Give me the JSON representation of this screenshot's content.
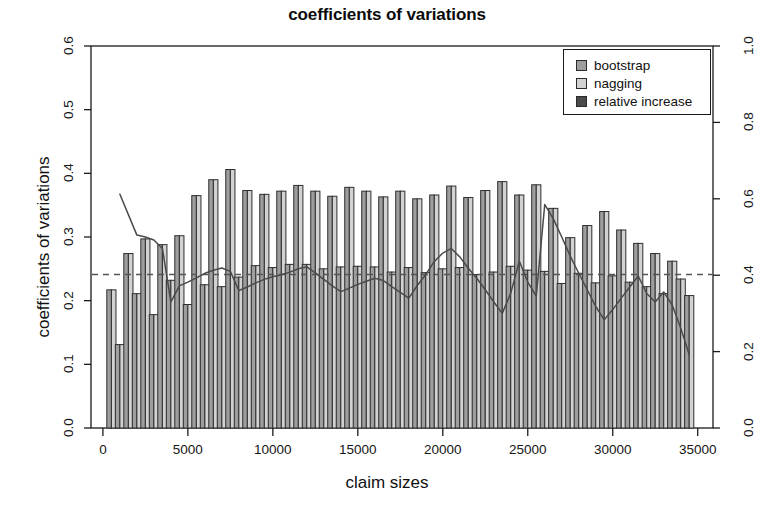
{
  "chart_data": {
    "type": "bar",
    "title": "coefficients of variations",
    "xlabel": "claim sizes",
    "ylabel": "coefficients of variations",
    "ylabel_right": "",
    "xlim": [
      -700,
      35900
    ],
    "ylim": [
      0.0,
      0.6
    ],
    "ylim_right": [
      0.0,
      1.0
    ],
    "grid": false,
    "xticks": [
      0,
      5000,
      10000,
      15000,
      20000,
      25000,
      30000,
      35000
    ],
    "xticklabels": [
      "0",
      "5000",
      "10000",
      "15000",
      "20000",
      "25000",
      "30000",
      "35000"
    ],
    "yticks": [
      0.0,
      0.1,
      0.2,
      0.3,
      0.4,
      0.5,
      0.6
    ],
    "yticklabels": [
      "0.0",
      "0.1",
      "0.2",
      "0.3",
      "0.4",
      "0.5",
      "0.6"
    ],
    "yticks_right": [
      0.0,
      0.2,
      0.4,
      0.6,
      0.8,
      1.0
    ],
    "yticklabels_right": [
      "0.0",
      "0.2",
      "0.4",
      "0.6",
      "0.8",
      "1.0"
    ],
    "legend": {
      "position": "top-right",
      "entries": [
        {
          "label": "bootstrap",
          "color": "#9e9e9e"
        },
        {
          "label": "nagging",
          "color": "#d2d2d2"
        },
        {
          "label": "relative increase",
          "color": "#4a4a4a"
        }
      ]
    },
    "reference_line": {
      "label": "mean reference",
      "value": 0.241,
      "style": "dashed",
      "color": "#555555"
    },
    "x": [
      500,
      1000,
      1500,
      2000,
      2500,
      3000,
      3500,
      4000,
      4500,
      5000,
      5500,
      6000,
      6500,
      7000,
      7500,
      8000,
      8500,
      9000,
      9500,
      10000,
      10500,
      11000,
      11500,
      12000,
      12500,
      13000,
      13500,
      14000,
      14500,
      15000,
      15500,
      16000,
      16500,
      17000,
      17500,
      18000,
      18500,
      19000,
      19500,
      20000,
      20500,
      21000,
      21500,
      22000,
      22500,
      23000,
      23500,
      24000,
      24500,
      25000,
      25500,
      26000,
      26500,
      27000,
      27500,
      28000,
      28500,
      29000,
      29500,
      30000,
      30500,
      31000,
      31500,
      32000,
      32500,
      33000,
      33500,
      34000,
      34500
    ],
    "categories": [
      "500",
      "1000",
      "1500",
      "2000",
      "2500",
      "3000",
      "3500",
      "4000",
      "4500",
      "5000",
      "5500",
      "6000",
      "6500",
      "7000",
      "7500",
      "8000",
      "8500",
      "9000",
      "9500",
      "10000",
      "10500",
      "11000",
      "11500",
      "12000",
      "12500",
      "13000",
      "13500",
      "14000",
      "14500",
      "15000",
      "15500",
      "16000",
      "16500",
      "17000",
      "17500",
      "18000",
      "18500",
      "19000",
      "19500",
      "20000",
      "20500",
      "21000",
      "21500",
      "22000",
      "22500",
      "23000",
      "23500",
      "24000",
      "24500",
      "25000",
      "25500",
      "26000",
      "26500",
      "27000",
      "27500",
      "28000",
      "28500",
      "29000",
      "29500",
      "30000",
      "30500",
      "31000",
      "31500",
      "32000",
      "32500",
      "33000",
      "33500",
      "34000",
      "34500"
    ],
    "series": [
      {
        "name": "bootstrap",
        "color": "#9e9e9e",
        "values": [
          0.217,
          0.131,
          0.274,
          0.211,
          0.297,
          0.178,
          0.288,
          0.232,
          0.302,
          0.194,
          0.365,
          0.225,
          0.39,
          0.222,
          0.406,
          0.237,
          0.373,
          0.255,
          0.367,
          0.252,
          0.372,
          0.257,
          0.381,
          0.257,
          0.372,
          0.25,
          0.364,
          0.253,
          0.378,
          0.254,
          0.372,
          0.253,
          0.363,
          0.245,
          0.372,
          0.252,
          0.36,
          0.244,
          0.366,
          0.25,
          0.38,
          0.252,
          0.362,
          0.241,
          0.373,
          0.245,
          0.387,
          0.254,
          0.366,
          0.248,
          0.382,
          0.246,
          0.345,
          0.227,
          0.299,
          0.243,
          0.318,
          0.228,
          0.34,
          0.239,
          0.311,
          0.229,
          0.29,
          0.222,
          0.274,
          0.211,
          0.262,
          0.234,
          0.208
        ]
      },
      {
        "name": "nagging",
        "color": "#d2d2d2",
        "values": [
          0.217,
          0.131,
          0.274,
          0.211,
          0.297,
          0.178,
          0.288,
          0.232,
          0.302,
          0.194,
          0.365,
          0.225,
          0.39,
          0.222,
          0.406,
          0.237,
          0.373,
          0.255,
          0.367,
          0.252,
          0.372,
          0.257,
          0.381,
          0.257,
          0.372,
          0.25,
          0.364,
          0.253,
          0.378,
          0.254,
          0.372,
          0.253,
          0.363,
          0.245,
          0.372,
          0.252,
          0.36,
          0.244,
          0.366,
          0.25,
          0.38,
          0.252,
          0.362,
          0.241,
          0.373,
          0.245,
          0.387,
          0.254,
          0.366,
          0.248,
          0.382,
          0.246,
          0.345,
          0.227,
          0.299,
          0.243,
          0.318,
          0.228,
          0.34,
          0.239,
          0.311,
          0.229,
          0.29,
          0.222,
          0.274,
          0.211,
          0.262,
          0.234,
          0.208
        ]
      }
    ],
    "line_series": {
      "name": "relative increase",
      "color": "#4a4a4a",
      "axis": "right",
      "x": [
        1000,
        2000,
        2500,
        3000,
        3500,
        4000,
        4500,
        5000,
        5500,
        6000,
        6500,
        7000,
        7500,
        8000,
        8500,
        9000,
        9500,
        10000,
        10500,
        11000,
        11500,
        12000,
        12500,
        13000,
        13500,
        14000,
        14500,
        15000,
        15500,
        16000,
        16500,
        17000,
        17500,
        18000,
        18500,
        19000,
        19500,
        20000,
        20500,
        21000,
        21500,
        22000,
        22500,
        23000,
        23500,
        24000,
        24500,
        25000,
        25500,
        26000,
        26500,
        27000,
        27500,
        28000,
        28500,
        29000,
        29500,
        30000,
        30500,
        31000,
        31500,
        32000,
        32500,
        33000,
        33500,
        34000,
        34500
      ],
      "values_right_axis": [
        0.612,
        0.505,
        0.5,
        0.492,
        0.47,
        0.33,
        0.372,
        0.382,
        0.393,
        0.405,
        0.413,
        0.419,
        0.41,
        0.36,
        0.369,
        0.38,
        0.389,
        0.396,
        0.401,
        0.408,
        0.417,
        0.422,
        0.406,
        0.389,
        0.372,
        0.357,
        0.366,
        0.376,
        0.384,
        0.392,
        0.386,
        0.37,
        0.355,
        0.34,
        0.373,
        0.402,
        0.436,
        0.458,
        0.47,
        0.448,
        0.418,
        0.392,
        0.362,
        0.33,
        0.3,
        0.353,
        0.437,
        0.382,
        0.345,
        0.585,
        0.548,
        0.5,
        0.45,
        0.405,
        0.362,
        0.318,
        0.283,
        0.31,
        0.34,
        0.369,
        0.398,
        0.352,
        0.33,
        0.356,
        0.322,
        0.262,
        0.192
      ]
    }
  }
}
